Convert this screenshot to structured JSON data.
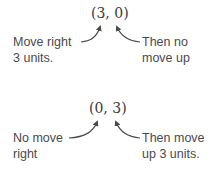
{
  "examples": [
    {
      "coordinate": "(3, 0)",
      "left_label": [
        "Move right",
        "3 units."
      ],
      "right_label": [
        "Then no",
        "move up"
      ]
    },
    {
      "coordinate": "(0, 3)",
      "left_label": [
        "No move",
        "right"
      ],
      "right_label": [
        "Then move",
        "up 3 units."
      ]
    }
  ],
  "colors": {
    "text": "#3a3a3a",
    "arrow": "#4a4a4a",
    "background": "#ffffff"
  }
}
